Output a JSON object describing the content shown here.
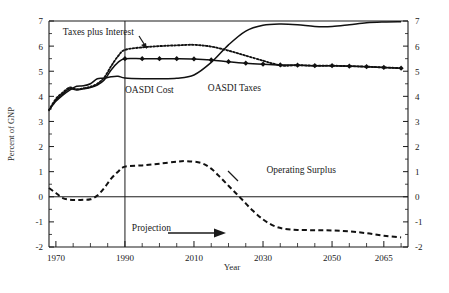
{
  "chart_data": {
    "type": "line",
    "title": "",
    "xlabel": "Year",
    "ylabel": "Percent of GNP",
    "xlim": [
      1968,
      2072
    ],
    "ylim": [
      -2,
      7
    ],
    "ytick_values": [
      -2,
      -1,
      0,
      1,
      2,
      3,
      4,
      5,
      6,
      7
    ],
    "ytick_labels": [
      "-2",
      "-1",
      "0",
      "1",
      "2",
      "3",
      "4",
      "5",
      "6",
      "7"
    ],
    "ytick_labels_right": [
      "-2",
      "-1",
      "0",
      "1",
      "2",
      "3",
      "4",
      "5",
      "6",
      "7"
    ],
    "xtick_values": [
      1970,
      1990,
      2010,
      2030,
      2050,
      2065
    ],
    "xtick_labels": [
      "1970",
      "1990",
      "2010",
      "2030",
      "2050",
      "2065"
    ],
    "xtick_minor_step": 5,
    "grid": false,
    "legend_position": "inline-annotations",
    "zero_line": 0,
    "projection_start_year": 1990,
    "annotations": [
      {
        "name": "taxes-plus-interest-label",
        "text": "Taxes plus Interest",
        "x": 1972,
        "y": 6.45,
        "leader": true
      },
      {
        "name": "oasdi-cost-label",
        "text": "OASDI Cost",
        "x": 1990,
        "y": 4.15,
        "leader": false
      },
      {
        "name": "oasdi-taxes-label",
        "text": "OASDI Taxes",
        "x": 2014,
        "y": 4.2,
        "leader": false
      },
      {
        "name": "operating-surplus-label",
        "text": "Operating Surplus",
        "x": 2031,
        "y": 0.95,
        "leader": true
      },
      {
        "name": "projection-label",
        "text": "Projection",
        "x": 1992,
        "y": -1.35,
        "leader": false
      }
    ],
    "series": [
      {
        "name": "OASDI Taxes",
        "style": "solid-with-diamond-markers",
        "color": "#111111",
        "marker": "diamond",
        "points": [
          [
            1968,
            3.45
          ],
          [
            1970,
            3.85
          ],
          [
            1972,
            4.1
          ],
          [
            1974,
            4.3
          ],
          [
            1976,
            4.25
          ],
          [
            1978,
            4.3
          ],
          [
            1980,
            4.35
          ],
          [
            1982,
            4.45
          ],
          [
            1984,
            4.65
          ],
          [
            1986,
            5.05
          ],
          [
            1988,
            5.35
          ],
          [
            1990,
            5.5
          ],
          [
            1995,
            5.5
          ],
          [
            2000,
            5.5
          ],
          [
            2005,
            5.5
          ],
          [
            2010,
            5.49
          ],
          [
            2015,
            5.45
          ],
          [
            2020,
            5.38
          ],
          [
            2025,
            5.32
          ],
          [
            2030,
            5.28
          ],
          [
            2035,
            5.25
          ],
          [
            2040,
            5.24
          ],
          [
            2045,
            5.22
          ],
          [
            2050,
            5.22
          ],
          [
            2055,
            5.2
          ],
          [
            2060,
            5.18
          ],
          [
            2065,
            5.15
          ],
          [
            2070,
            5.12
          ]
        ],
        "marker_years": [
          1990,
          1995,
          2000,
          2005,
          2010,
          2015,
          2020,
          2025,
          2030,
          2035,
          2040,
          2045,
          2050,
          2055,
          2060,
          2065,
          2070
        ]
      },
      {
        "name": "Taxes plus Interest",
        "style": "dotted",
        "color": "#111111",
        "points": [
          [
            1968,
            3.45
          ],
          [
            1970,
            3.9
          ],
          [
            1972,
            4.15
          ],
          [
            1974,
            4.35
          ],
          [
            1976,
            4.28
          ],
          [
            1978,
            4.32
          ],
          [
            1980,
            4.38
          ],
          [
            1982,
            4.5
          ],
          [
            1984,
            4.75
          ],
          [
            1986,
            5.2
          ],
          [
            1988,
            5.6
          ],
          [
            1990,
            5.85
          ],
          [
            1995,
            5.95
          ],
          [
            2000,
            6.0
          ],
          [
            2005,
            6.03
          ],
          [
            2010,
            6.05
          ],
          [
            2015,
            5.98
          ],
          [
            2020,
            5.82
          ],
          [
            2025,
            5.62
          ],
          [
            2030,
            5.42
          ],
          [
            2033,
            5.3
          ],
          [
            2036,
            5.22
          ],
          [
            2040,
            5.24
          ],
          [
            2045,
            5.22
          ],
          [
            2050,
            5.22
          ],
          [
            2055,
            5.2
          ],
          [
            2060,
            5.18
          ],
          [
            2065,
            5.15
          ],
          [
            2070,
            5.12
          ]
        ]
      },
      {
        "name": "OASDI Cost",
        "style": "solid",
        "color": "#111111",
        "points": [
          [
            1968,
            3.45
          ],
          [
            1970,
            3.8
          ],
          [
            1972,
            4.05
          ],
          [
            1974,
            4.25
          ],
          [
            1976,
            4.4
          ],
          [
            1978,
            4.42
          ],
          [
            1980,
            4.5
          ],
          [
            1982,
            4.7
          ],
          [
            1984,
            4.72
          ],
          [
            1986,
            4.78
          ],
          [
            1988,
            4.8
          ],
          [
            1990,
            4.73
          ],
          [
            1995,
            4.7
          ],
          [
            2000,
            4.7
          ],
          [
            2005,
            4.72
          ],
          [
            2010,
            4.85
          ],
          [
            2015,
            5.35
          ],
          [
            2020,
            6.05
          ],
          [
            2025,
            6.6
          ],
          [
            2030,
            6.83
          ],
          [
            2035,
            6.88
          ],
          [
            2040,
            6.85
          ],
          [
            2045,
            6.78
          ],
          [
            2050,
            6.78
          ],
          [
            2055,
            6.85
          ],
          [
            2060,
            6.93
          ],
          [
            2065,
            6.96
          ],
          [
            2070,
            6.97
          ]
        ]
      },
      {
        "name": "Operating Surplus",
        "style": "dashed",
        "color": "#111111",
        "points": [
          [
            1968,
            0.35
          ],
          [
            1970,
            0.15
          ],
          [
            1972,
            -0.05
          ],
          [
            1974,
            -0.12
          ],
          [
            1976,
            -0.13
          ],
          [
            1978,
            -0.12
          ],
          [
            1980,
            -0.1
          ],
          [
            1982,
            0.05
          ],
          [
            1984,
            0.35
          ],
          [
            1986,
            0.72
          ],
          [
            1988,
            1.0
          ],
          [
            1990,
            1.2
          ],
          [
            1995,
            1.25
          ],
          [
            2000,
            1.32
          ],
          [
            2005,
            1.4
          ],
          [
            2008,
            1.42
          ],
          [
            2012,
            1.35
          ],
          [
            2015,
            1.12
          ],
          [
            2018,
            0.72
          ],
          [
            2021,
            0.3
          ],
          [
            2024,
            -0.12
          ],
          [
            2027,
            -0.55
          ],
          [
            2030,
            -0.9
          ],
          [
            2033,
            -1.15
          ],
          [
            2036,
            -1.27
          ],
          [
            2040,
            -1.32
          ],
          [
            2045,
            -1.33
          ],
          [
            2050,
            -1.34
          ],
          [
            2055,
            -1.38
          ],
          [
            2060,
            -1.45
          ],
          [
            2065,
            -1.55
          ],
          [
            2070,
            -1.62
          ]
        ]
      }
    ]
  },
  "axis": {
    "ylabel": "Percent of GNP",
    "xlabel": "Year"
  }
}
